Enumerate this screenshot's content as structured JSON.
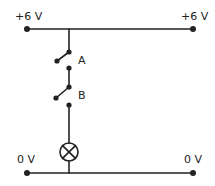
{
  "diagram": {
    "type": "circuit",
    "labels": {
      "top_left": "+6 V",
      "top_right": "+6 V",
      "bottom_left": "0 V",
      "bottom_right": "0 V",
      "switch_a": "A",
      "switch_b": "B"
    },
    "components": [
      {
        "id": "switch-a",
        "kind": "switch",
        "state": "open",
        "label": "A"
      },
      {
        "id": "switch-b",
        "kind": "switch",
        "state": "open",
        "label": "B"
      },
      {
        "id": "lamp",
        "kind": "lamp"
      }
    ],
    "connections": "Switches A and B in series with lamp between +6 V rail and 0 V rail",
    "colors": {
      "line": "#222222",
      "background": "#ffffff"
    }
  }
}
